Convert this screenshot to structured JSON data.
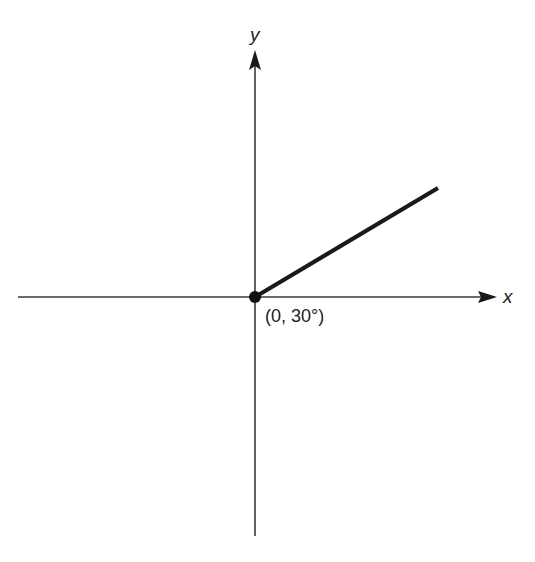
{
  "diagram": {
    "axes": {
      "x_label": "x",
      "y_label": "y"
    },
    "point": {
      "label": "(0, 30°)",
      "r": 0,
      "theta_deg": 30
    },
    "ray": {
      "angle_deg": 30,
      "description": "Ray from origin at 30 degrees"
    },
    "colors": {
      "axis": "#3a3a3a",
      "ray": "#1a1a1a",
      "background": "#ffffff"
    }
  }
}
